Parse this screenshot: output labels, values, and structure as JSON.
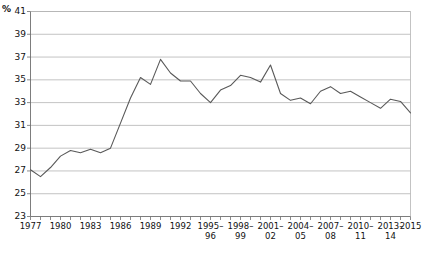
{
  "chart_data": {
    "type": "line",
    "title": "",
    "subtitle": "",
    "xlabel": "",
    "ylabel": "%",
    "unit_label": "%",
    "ylim": [
      23,
      41
    ],
    "y_ticks": [
      23,
      25,
      27,
      29,
      31,
      33,
      35,
      37,
      39,
      41
    ],
    "grid": true,
    "legend": "none",
    "x_tick_labels": [
      {
        "line1": "1977",
        "line2": "",
        "x": 1977
      },
      {
        "line1": "1980",
        "line2": "",
        "x": 1980
      },
      {
        "line1": "1983",
        "line2": "",
        "x": 1983
      },
      {
        "line1": "1986",
        "line2": "",
        "x": 1986
      },
      {
        "line1": "1989",
        "line2": "",
        "x": 1989
      },
      {
        "line1": "1992",
        "line2": "",
        "x": 1992
      },
      {
        "line1": "1995–",
        "line2": "96",
        "x": 1995
      },
      {
        "line1": "1998–",
        "line2": "99",
        "x": 1998
      },
      {
        "line1": "2001–",
        "line2": "02",
        "x": 2001
      },
      {
        "line1": "2004–",
        "line2": "05",
        "x": 2004
      },
      {
        "line1": "2007–",
        "line2": "08",
        "x": 2007
      },
      {
        "line1": "2010–",
        "line2": "11",
        "x": 2010
      },
      {
        "line1": "2013–",
        "line2": "14",
        "x": 2013
      },
      {
        "line1": "2015",
        "line2": "",
        "x": 2015
      }
    ],
    "x": [
      1977,
      1978,
      1979,
      1980,
      1981,
      1982,
      1983,
      1984,
      1985,
      1986,
      1987,
      1988,
      1989,
      1990,
      1991,
      1992,
      1993,
      1994,
      1995,
      1996,
      1997,
      1998,
      1999,
      2000,
      2001,
      2002,
      2003,
      2004,
      2005,
      2006,
      2007,
      2008,
      2009,
      2010,
      2011,
      2012,
      2013,
      2014,
      2015
    ],
    "values": [
      27.1,
      26.5,
      27.3,
      28.3,
      28.8,
      28.6,
      28.9,
      28.6,
      29.0,
      31.2,
      33.4,
      35.2,
      34.6,
      36.8,
      35.6,
      34.9,
      34.9,
      33.8,
      33.0,
      34.1,
      34.5,
      35.4,
      35.2,
      34.8,
      36.3,
      33.8,
      33.2,
      33.4,
      32.9,
      34.0,
      34.4,
      33.8,
      34.0,
      33.5,
      33.0,
      32.5,
      33.3,
      33.1,
      32.1
    ],
    "line_color": "#595959",
    "grid_color": "#b4b4b4",
    "axis_color": "#6e6e6e"
  }
}
